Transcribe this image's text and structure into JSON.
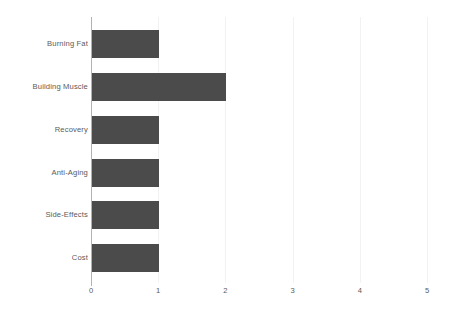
{
  "chart_data": {
    "type": "bar",
    "orientation": "horizontal",
    "title": "",
    "subtitle": "",
    "xlabel": "",
    "ylabel": "",
    "categories": [
      "Burning Fat",
      "Building Muscle",
      "Recovery",
      "Anti-Aging",
      "Side-Effects",
      "Cost"
    ],
    "values": [
      1,
      2,
      1,
      1,
      1,
      1
    ],
    "series": [
      {
        "name": "",
        "values": [
          1,
          2,
          1,
          1,
          1,
          1
        ]
      }
    ],
    "xlim": [
      0,
      5
    ],
    "ylim": [
      0,
      6
    ],
    "x_ticks": [
      "0",
      "1",
      "2",
      "3",
      "4",
      "5"
    ],
    "x_tick_values": [
      0,
      1,
      2,
      3,
      4,
      5
    ],
    "grid": "vertical",
    "legend": "none",
    "bar_color": "#4b4b4b",
    "gridline_color": "#f2f2f2",
    "axis_color": "#b2b2b2",
    "text_color": "#5a5a5a",
    "background_color": "#ffffff"
  }
}
